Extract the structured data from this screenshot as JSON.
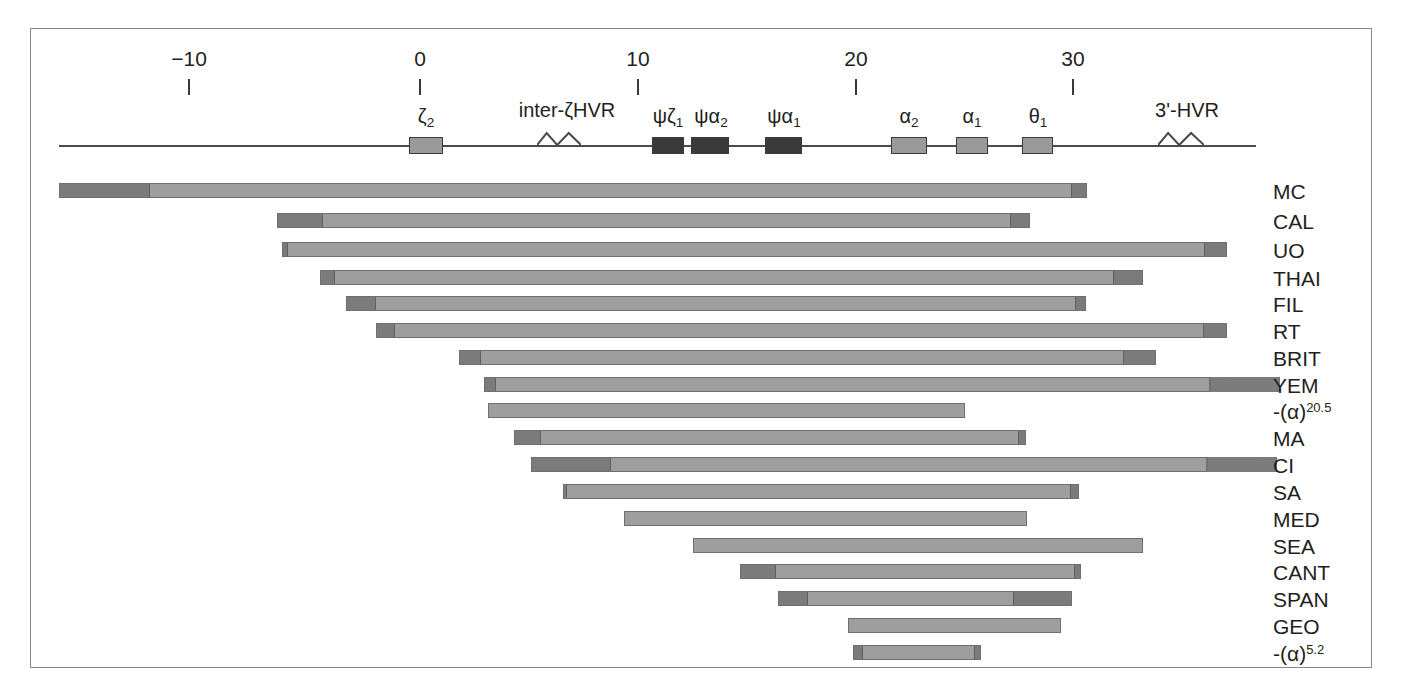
{
  "figure": {
    "frame_color": "#8a8a8a"
  },
  "axis": {
    "label_unit": "kb",
    "ticks": [
      {
        "label": "−10",
        "value": -10,
        "x": 188
      },
      {
        "label": "0",
        "value": 0,
        "x": 419
      },
      {
        "label": "10",
        "value": 10,
        "x": 637
      },
      {
        "label": "20",
        "value": 20,
        "x": 855
      },
      {
        "label": "30",
        "value": 30,
        "x": 1072
      }
    ],
    "scale_px_per_unit": 21.8,
    "origin_px": 419
  },
  "genome_line": {
    "x_start": 58,
    "x_end": 1255,
    "y": 144,
    "color": "#4a4a4a"
  },
  "genes": [
    {
      "name": "zeta-2",
      "label": "ζ",
      "sub": "2",
      "x": 408,
      "width": 34,
      "shade": "light",
      "label_x": 425
    },
    {
      "name": "inter-zeta-HVR",
      "label": "inter-ζHVR",
      "sub": "",
      "x": 536,
      "width": 44,
      "shade": "hvr",
      "label_x": 566
    },
    {
      "name": "psi-zeta-1",
      "label": "ψζ",
      "sub": "1",
      "x": 651,
      "width": 32,
      "shade": "dark",
      "label_x": 667
    },
    {
      "name": "psi-alpha-2",
      "label": "ψα",
      "sub": "2",
      "x": 690,
      "width": 38,
      "shade": "dark",
      "label_x": 710
    },
    {
      "name": "psi-alpha-1",
      "label": "ψα",
      "sub": "1",
      "x": 764,
      "width": 37,
      "shade": "dark",
      "label_x": 783
    },
    {
      "name": "alpha-2",
      "label": "α",
      "sub": "2",
      "x": 890,
      "width": 36,
      "shade": "light",
      "label_x": 908
    },
    {
      "name": "alpha-1",
      "label": "α",
      "sub": "1",
      "x": 955,
      "width": 32,
      "shade": "light",
      "label_x": 971
    },
    {
      "name": "theta-1",
      "label": "θ",
      "sub": "1",
      "x": 1021,
      "width": 31,
      "shade": "light",
      "label_x": 1037
    },
    {
      "name": "three-prime-HVR",
      "label": "3'-HVR",
      "sub": "",
      "x": 1157,
      "width": 46,
      "shade": "hvr",
      "label_x": 1186
    }
  ],
  "deletion_rows": [
    {
      "label": "MC",
      "sup": "",
      "y": 182,
      "x": 58,
      "width": 1028,
      "cap_left": 90,
      "cap_right": 15,
      "wavy": false
    },
    {
      "label": "CAL",
      "sup": "",
      "y": 212,
      "x": 276,
      "width": 753,
      "cap_left": 45,
      "cap_right": 19,
      "wavy": false
    },
    {
      "label": "UO",
      "sup": "",
      "y": 241,
      "x": 281,
      "width": 945,
      "cap_left": 5,
      "cap_right": 22,
      "wavy": false
    },
    {
      "label": "THAI",
      "sup": "",
      "y": 269,
      "x": 319,
      "width": 823,
      "cap_left": 14,
      "cap_right": 29,
      "wavy": false
    },
    {
      "label": "FIL",
      "sup": "",
      "y": 295,
      "x": 345,
      "width": 740,
      "cap_left": 29,
      "cap_right": 10,
      "wavy": false
    },
    {
      "label": "RT",
      "sup": "",
      "y": 322,
      "x": 375,
      "width": 851,
      "cap_left": 18,
      "cap_right": 23,
      "wavy": false
    },
    {
      "label": "BRIT",
      "sup": "",
      "y": 349,
      "x": 458,
      "width": 697,
      "cap_left": 21,
      "cap_right": 32,
      "wavy": false
    },
    {
      "label": "YEM",
      "sup": "",
      "y": 376,
      "x": 483,
      "width": 726,
      "cap_left": 11,
      "cap_right": 0,
      "wavy": true
    },
    {
      "label": "-(α)",
      "sup": "20.5",
      "y": 402,
      "x": 487,
      "width": 477,
      "cap_left": 0,
      "cap_right": 0,
      "wavy": false
    },
    {
      "label": "MA",
      "sup": "",
      "y": 429,
      "x": 513,
      "width": 512,
      "cap_left": 26,
      "cap_right": 7,
      "wavy": false
    },
    {
      "label": "CI",
      "sup": "",
      "y": 456,
      "x": 530,
      "width": 676,
      "cap_left": 79,
      "cap_right": 0,
      "wavy": true
    },
    {
      "label": "SA",
      "sup": "",
      "y": 483,
      "x": 562,
      "width": 516,
      "cap_left": 3,
      "cap_right": 8,
      "wavy": false
    },
    {
      "label": "MED",
      "sup": "",
      "y": 510,
      "x": 623,
      "width": 403,
      "cap_left": 0,
      "cap_right": 0,
      "wavy": false
    },
    {
      "label": "SEA",
      "sup": "",
      "y": 537,
      "x": 692,
      "width": 450,
      "cap_left": 0,
      "cap_right": 0,
      "wavy": false
    },
    {
      "label": "CANT",
      "sup": "",
      "y": 563,
      "x": 739,
      "width": 341,
      "cap_left": 35,
      "cap_right": 6,
      "wavy": false
    },
    {
      "label": "SPAN",
      "sup": "",
      "y": 590,
      "x": 777,
      "width": 294,
      "cap_left": 29,
      "cap_right": 58,
      "wavy": false
    },
    {
      "label": "GEO",
      "sup": "",
      "y": 617,
      "x": 847,
      "width": 213,
      "cap_left": 0,
      "cap_right": 0,
      "wavy": false
    },
    {
      "label": "-(α)",
      "sup": "5.2",
      "y": 644,
      "x": 852,
      "width": 128,
      "cap_left": 9,
      "cap_right": 6,
      "wavy": false
    }
  ],
  "colors": {
    "bar_fill": "#9e9e9e",
    "bar_cap": "#7b7b7b",
    "bar_border": "#6f6f6f",
    "gene_dark": "#3a3a3a",
    "gene_light": "#9a9a9a",
    "line": "#4a4a4a",
    "text": "#231f20"
  }
}
